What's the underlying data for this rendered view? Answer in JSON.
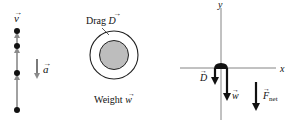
{
  "motion_diagram": {
    "velocity_label": "v",
    "acceleration_label": "a",
    "dot_positions_y": [
      31,
      46,
      73,
      110
    ],
    "arrow_color": "#8a8a8a",
    "dot_color": "#111111"
  },
  "object_figure": {
    "drag_label_prefix": "Drag ",
    "drag_symbol": "D",
    "weight_label_prefix": "Weight ",
    "weight_symbol": "w",
    "inner_fill": "#bdbdbd"
  },
  "free_body_diagram": {
    "x_axis_label": "x",
    "y_axis_label": "y",
    "drag_symbol": "D",
    "weight_symbol": "w",
    "net_force_symbol": "F",
    "net_force_subscript": "net"
  }
}
